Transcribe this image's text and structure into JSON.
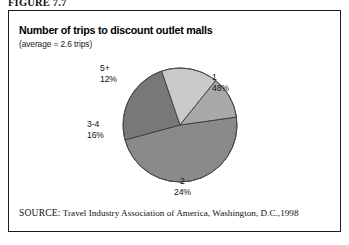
{
  "figure": {
    "label": "FIGURE 7.7",
    "border_color": "#1b1b1b",
    "background": "#ffffff"
  },
  "chart_data": {
    "type": "pie",
    "title": "Number of trips to discount outlet malls",
    "subtitle": "(average = 2.6 trips)",
    "categories": [
      "1",
      "2",
      "3-4",
      "5+"
    ],
    "values": [
      48,
      24,
      16,
      12
    ],
    "value_unit": "%",
    "value_labels": [
      "48%",
      "24%",
      "16%",
      "12%"
    ],
    "colors": [
      "#8a8a8a",
      "#787878",
      "#c9c9c9",
      "#a9a9a9"
    ],
    "slice_border_color": "#3a3a3a",
    "legend": "none",
    "labels_position": "outside",
    "average": "2.6",
    "slices": [
      {
        "category": "1",
        "percent": 48,
        "percent_label": "48%",
        "color": "#8a8a8a"
      },
      {
        "category": "2",
        "percent": 24,
        "percent_label": "24%",
        "color": "#787878"
      },
      {
        "category": "3-4",
        "percent": 16,
        "percent_label": "16%",
        "color": "#c9c9c9"
      },
      {
        "category": "5+",
        "percent": 12,
        "percent_label": "12%",
        "color": "#a9a9a9"
      }
    ]
  },
  "source": {
    "kicker": "SOURCE:",
    "text": " Travel Industry Association of America, Washington, D.C.,1998"
  }
}
